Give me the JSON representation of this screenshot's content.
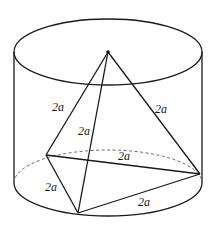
{
  "diagram": {
    "type": "geometry",
    "colors": {
      "stroke": "#1a1a1a",
      "hidden": "#666666",
      "background": "#ffffff"
    },
    "cylinder": {
      "left_x": 14,
      "right_x": 202,
      "top_ellipse": {
        "cx": 108,
        "cy": 52,
        "rx": 94,
        "ry": 33
      },
      "bottom_ellipse": {
        "cx": 108,
        "cy": 183,
        "rx": 94,
        "ry": 33
      }
    },
    "points": {
      "apex": {
        "x": 108,
        "y": 52
      },
      "left": {
        "x": 46,
        "y": 155
      },
      "front": {
        "x": 78,
        "y": 213
      },
      "right": {
        "x": 200,
        "y": 174
      }
    },
    "edge_labels": [
      {
        "id": "apex-left",
        "text": "2a",
        "x": 52,
        "y": 101
      },
      {
        "id": "apex-front",
        "text": "2a",
        "x": 78,
        "y": 125
      },
      {
        "id": "apex-right",
        "text": "2a",
        "x": 155,
        "y": 103
      },
      {
        "id": "left-right",
        "text": "2a",
        "x": 118,
        "y": 150
      },
      {
        "id": "left-front",
        "text": "2a",
        "x": 45,
        "y": 181
      },
      {
        "id": "front-right",
        "text": "2a",
        "x": 138,
        "y": 196
      }
    ]
  }
}
